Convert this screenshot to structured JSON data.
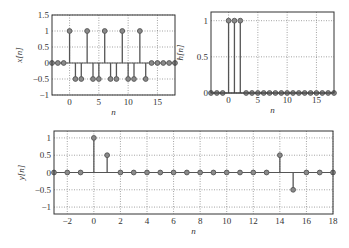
{
  "chart_data": [
    {
      "type": "stem",
      "id": "x",
      "ylabel": "x[n]",
      "xlabel": "n",
      "xlim": [
        -3,
        18
      ],
      "ylim": [
        -1,
        1.5
      ],
      "xticks": [
        0,
        5,
        10,
        15
      ],
      "yticks": [
        -1,
        -0.5,
        0,
        0.5,
        1,
        1.5
      ],
      "ytick_labels": [
        "−1",
        "−0.5",
        "0",
        "0.5",
        "1",
        "1.5"
      ],
      "grid": true,
      "n": [
        -3,
        -2,
        -1,
        0,
        1,
        2,
        3,
        4,
        5,
        6,
        7,
        8,
        9,
        10,
        11,
        12,
        13,
        14,
        15,
        16,
        17,
        18
      ],
      "values": [
        0,
        0,
        0,
        1,
        -0.5,
        -0.5,
        1,
        -0.5,
        -0.5,
        1,
        -0.5,
        -0.5,
        1,
        -0.5,
        -0.5,
        1,
        -0.5,
        0,
        0,
        0,
        0,
        0
      ],
      "box": {
        "x0": 52,
        "y0": 15,
        "x1": 175,
        "y1": 95
      }
    },
    {
      "type": "stem",
      "id": "h",
      "ylabel": "h[n]",
      "xlabel": "n",
      "xlim": [
        -3,
        18
      ],
      "ylim": [
        0,
        1.12
      ],
      "xticks": [
        0,
        5,
        10,
        15
      ],
      "yticks": [
        0,
        0.5,
        1
      ],
      "ytick_labels": [
        "0",
        "0.5",
        "1"
      ],
      "grid": true,
      "n": [
        -3,
        -2,
        -1,
        0,
        1,
        2,
        3,
        4,
        5,
        6,
        7,
        8,
        9,
        10,
        11,
        12,
        13,
        14,
        15,
        16,
        17,
        18
      ],
      "values": [
        0,
        0,
        0,
        1,
        1,
        1,
        0,
        0,
        0,
        0,
        0,
        0,
        0,
        0,
        0,
        0,
        0,
        0,
        0,
        0,
        0,
        0
      ],
      "box": {
        "x0": 211,
        "y0": 12,
        "x1": 334,
        "y1": 93
      }
    },
    {
      "type": "stem",
      "id": "y",
      "ylabel": "y[n]",
      "xlabel": "n",
      "xlim": [
        -3,
        18
      ],
      "ylim": [
        -1.2,
        1.2
      ],
      "xticks": [
        -2,
        0,
        2,
        4,
        6,
        8,
        10,
        12,
        14,
        16,
        18
      ],
      "yticks": [
        -1,
        -0.5,
        0,
        0.5,
        1
      ],
      "ytick_labels": [
        "−1",
        "−0.5",
        "0",
        "0.5",
        "1"
      ],
      "grid": true,
      "n": [
        -3,
        -2,
        -1,
        0,
        1,
        2,
        3,
        4,
        5,
        6,
        7,
        8,
        9,
        10,
        11,
        12,
        13,
        14,
        15,
        16,
        17,
        18
      ],
      "values": [
        0,
        0,
        0,
        1,
        0.5,
        0,
        0,
        0,
        0,
        0,
        0,
        0,
        0,
        0,
        0,
        0,
        0,
        0.5,
        -0.5,
        0,
        0,
        0
      ],
      "box": {
        "x0": 54,
        "y0": 131,
        "x1": 333,
        "y1": 214
      }
    }
  ],
  "colors": {
    "stem": "#555555",
    "marker_fill": "#8a8a8a",
    "axis": "#333333",
    "grid": "#666666"
  }
}
